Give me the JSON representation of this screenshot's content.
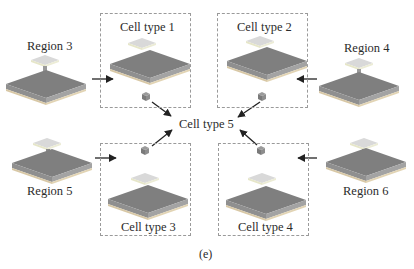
{
  "figure": {
    "caption": "(e)",
    "regions": [
      {
        "id": "region-3",
        "label": "Region 3"
      },
      {
        "id": "region-4",
        "label": "Region 4"
      },
      {
        "id": "region-5",
        "label": "Region 5"
      },
      {
        "id": "region-6",
        "label": "Region 6"
      }
    ],
    "cell_types": [
      {
        "id": "cell-type-1",
        "label": "Cell type 1"
      },
      {
        "id": "cell-type-2",
        "label": "Cell type 2"
      },
      {
        "id": "cell-type-3",
        "label": "Cell type 3"
      },
      {
        "id": "cell-type-4",
        "label": "Cell type 4"
      }
    ],
    "center": {
      "label": "Cell type 5"
    },
    "edges": [
      {
        "from": "Region 3",
        "to": "Cell type 1"
      },
      {
        "from": "Region 4",
        "to": "Cell type 2"
      },
      {
        "from": "Region 5",
        "to": "Cell type 3"
      },
      {
        "from": "Region 6",
        "to": "Cell type 4"
      },
      {
        "from": "Cell type 1",
        "to": "Cell type 5"
      },
      {
        "from": "Cell type 2",
        "to": "Cell type 5"
      },
      {
        "from": "Cell type 3",
        "to": "Cell type 5"
      },
      {
        "from": "Cell type 4",
        "to": "Cell type 5"
      }
    ],
    "colors": {
      "plate_top": "#7d7d7d",
      "plate_side": "#9a9a9a",
      "plate_base": "#d9c9a8",
      "small_plate": "#d6d6d6",
      "cube": "#8a8a8a",
      "dash": "#9a9a9a",
      "arrow": "#222222"
    }
  }
}
